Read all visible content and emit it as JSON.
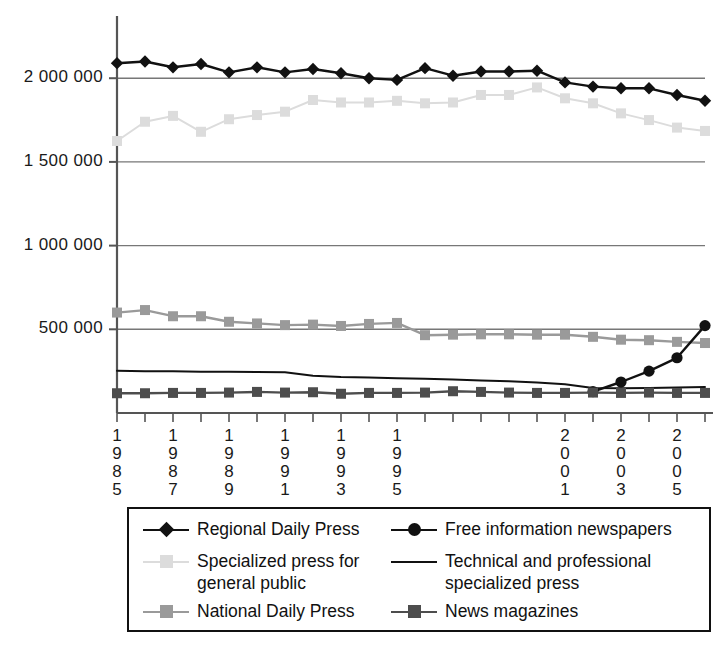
{
  "chart_data": {
    "type": "line",
    "title": "",
    "xlabel": "",
    "ylabel": "",
    "x": [
      1985,
      1986,
      1987,
      1988,
      1989,
      1990,
      1991,
      1992,
      1993,
      1994,
      1995,
      1996,
      1997,
      1998,
      1999,
      2000,
      2001,
      2002,
      2003,
      2004,
      2005,
      2006
    ],
    "xlim": [
      1985,
      2006
    ],
    "ylim": [
      0,
      2300000
    ],
    "grid": true,
    "legend_position": "bottom",
    "x_tick_labels": [
      "1985",
      "1987",
      "1989",
      "1991",
      "1993",
      "1995",
      "2001",
      "2003",
      "2005"
    ],
    "x_tick_label_years": [
      1985,
      1987,
      1989,
      1991,
      1993,
      1995,
      2001,
      2003,
      2005
    ],
    "y_tick_labels": [
      "500 000",
      "1 000 000",
      "1 500 000",
      "2 000 000"
    ],
    "y_ticks": [
      500000,
      1000000,
      1500000,
      2000000
    ],
    "series": [
      {
        "name": "Regional Daily Press",
        "marker": "diamond",
        "color": "#111111",
        "values": [
          2090000,
          2100000,
          2065000,
          2085000,
          2035000,
          2065000,
          2035000,
          2055000,
          2030000,
          2000000,
          1990000,
          2060000,
          2015000,
          2040000,
          2040000,
          2045000,
          1975000,
          1950000,
          1940000,
          1940000,
          1900000,
          1865000
        ]
      },
      {
        "name": "Specialized press for general public",
        "marker": "square",
        "color": "#dcdcdc",
        "values": [
          1625000,
          1740000,
          1775000,
          1680000,
          1755000,
          1780000,
          1800000,
          1870000,
          1855000,
          1855000,
          1865000,
          1850000,
          1855000,
          1900000,
          1900000,
          1945000,
          1880000,
          1850000,
          1790000,
          1750000,
          1705000,
          1685000
        ]
      },
      {
        "name": "National Daily Press",
        "marker": "square",
        "color": "#9a9a9a",
        "values": [
          600000,
          615000,
          578000,
          578000,
          545000,
          535000,
          525000,
          528000,
          520000,
          532000,
          538000,
          465000,
          468000,
          470000,
          470000,
          468000,
          468000,
          455000,
          438000,
          435000,
          425000,
          418000
        ]
      },
      {
        "name": "Free information newspapers",
        "marker": "circle",
        "color": "#111111",
        "values": [
          null,
          null,
          null,
          null,
          null,
          null,
          null,
          null,
          null,
          null,
          null,
          null,
          null,
          null,
          null,
          null,
          null,
          128000,
          185000,
          250000,
          330000,
          522000
        ]
      },
      {
        "name": "Technical and professional specialized press",
        "marker": "none",
        "color": "#111111",
        "values": [
          252000,
          250000,
          249000,
          247000,
          246000,
          245000,
          244000,
          222000,
          215000,
          212000,
          208000,
          205000,
          200000,
          195000,
          190000,
          182000,
          172000,
          150000,
          148000,
          150000,
          152000,
          155000
        ]
      },
      {
        "name": "News magazines",
        "marker": "square",
        "color": "#4d4d4d",
        "values": [
          118000,
          118000,
          120000,
          120000,
          122000,
          126000,
          122000,
          124000,
          115000,
          120000,
          120000,
          122000,
          130000,
          126000,
          122000,
          120000,
          120000,
          122000,
          120000,
          122000,
          120000,
          120000
        ]
      }
    ]
  },
  "legend": {
    "items": [
      {
        "label": "Regional Daily Press",
        "marker": "diamond",
        "color": "#111111",
        "icon": "diamond-marker-icon"
      },
      {
        "label": "Free information newspapers",
        "marker": "circle",
        "color": "#111111",
        "icon": "circle-marker-icon"
      },
      {
        "label": "Specialized press for general public",
        "marker": "square",
        "color": "#dcdcdc",
        "icon": "square-marker-icon"
      },
      {
        "label": "Technical and professional specialized press",
        "marker": "none",
        "color": "#111111",
        "icon": "line-sample-icon"
      },
      {
        "label": "National Daily Press",
        "marker": "square",
        "color": "#9a9a9a",
        "icon": "square-marker-icon"
      },
      {
        "label": "News magazines",
        "marker": "square",
        "color": "#4d4d4d",
        "icon": "square-marker-icon"
      }
    ]
  },
  "axes": {
    "axis_color": "#555555",
    "grid_color": "#777777"
  }
}
